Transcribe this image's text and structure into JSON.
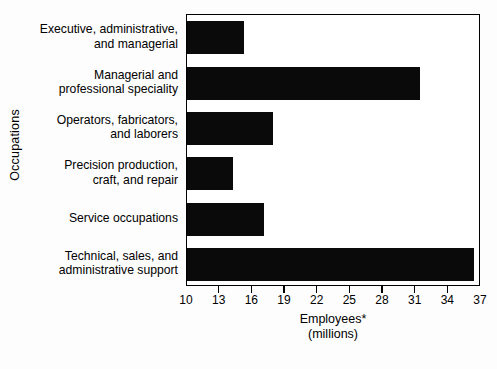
{
  "chart_data": {
    "type": "bar",
    "orientation": "horizontal",
    "title": "",
    "xlabel": "Employees*",
    "xlabel_line2": "(millions)",
    "ylabel": "Occupations",
    "xlim": [
      10,
      37
    ],
    "grid": false,
    "legend": null,
    "bar_color": "#0a0a0a",
    "plot_background": "#ffffff",
    "figure_background": "#fdfdfd",
    "xticks": [
      "10",
      "13",
      "16",
      "19",
      "22",
      "25",
      "28",
      "31",
      "34",
      "37"
    ],
    "xtick_values": [
      10,
      13,
      16,
      19,
      22,
      25,
      28,
      31,
      34,
      37
    ],
    "categories": [
      "Executive, administrative,\nand managerial",
      "Managerial and\nprofessional speciality",
      "Operators, fabricators,\nand laborers",
      "Precision production,\ncraft, and repair",
      "Service occupations",
      "Technical, sales, and\nadministrative support"
    ],
    "values": [
      15.2,
      31.4,
      17.9,
      14.2,
      17.1,
      36.4
    ]
  }
}
